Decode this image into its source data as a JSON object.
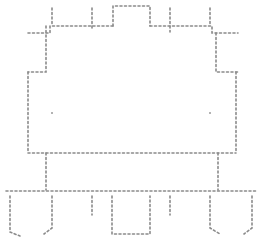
{
  "diagram": {
    "type": "sketch-outline",
    "stroke_color": "#8a8a8a",
    "background": "#ffffff",
    "labels": []
  }
}
